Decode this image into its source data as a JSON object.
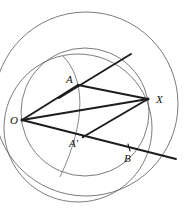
{
  "figure": {
    "background_color": "#ffffff",
    "stroke_color": "#1d1d1d",
    "curve_color": "#5b5b5b",
    "width": 186,
    "height": 213,
    "labels": [
      {
        "name": "label-O",
        "text": "O",
        "x": 10,
        "y": 124
      },
      {
        "name": "label-A",
        "text": "A",
        "x": 66,
        "y": 83
      },
      {
        "name": "label-A-prime",
        "text": "A′",
        "x": 69,
        "y": 147
      },
      {
        "name": "label-X",
        "text": "X",
        "x": 156,
        "y": 103
      },
      {
        "name": "label-B",
        "text": "B",
        "x": 124,
        "y": 162
      }
    ],
    "points": [
      {
        "name": "point-O",
        "label": "O",
        "x": 22,
        "y": 120
      },
      {
        "name": "point-A",
        "label": "A",
        "x": 78,
        "y": 85
      },
      {
        "name": "point-A-prime",
        "label": "A'",
        "x": 83,
        "y": 137
      },
      {
        "name": "point-X",
        "label": "X",
        "x": 148,
        "y": 99
      },
      {
        "name": "point-B",
        "label": "B",
        "x": 128,
        "y": 150
      }
    ],
    "circles": [
      {
        "name": "circle-large-upper",
        "cx": 86,
        "cy": 104,
        "r": 92
      },
      {
        "name": "circle-lower-left",
        "cx": 78,
        "cy": 128,
        "r": 74
      },
      {
        "name": "circle-through-O-X",
        "cx": 85,
        "cy": 112,
        "r": 64
      }
    ],
    "arcs": [
      {
        "name": "arc-through-A-and-A-prime",
        "d": "M 63 56 C 84 78, 88 118, 60 177"
      }
    ],
    "segments": [
      {
        "name": "segment-O-A",
        "x1": 22,
        "y1": 120,
        "x2": 78,
        "y2": 85
      },
      {
        "name": "segment-A-X",
        "x1": 78,
        "y1": 85,
        "x2": 148,
        "y2": 99
      },
      {
        "name": "segment-O-X",
        "x1": 22,
        "y1": 120,
        "x2": 148,
        "y2": 99
      },
      {
        "name": "segment-A-prime-X",
        "x1": 83,
        "y1": 137,
        "x2": 148,
        "y2": 99
      }
    ],
    "rays": [
      {
        "name": "ray-O-through-B",
        "x1": 22,
        "y1": 120,
        "x2": 176,
        "y2": 159
      },
      {
        "name": "ray-through-A-diagonal",
        "x1": 59,
        "y1": 98,
        "x2": 131,
        "y2": 54
      }
    ],
    "ticks": [
      {
        "name": "tick-on-ray-near-B",
        "x1": 128,
        "y1": 145,
        "x2": 130,
        "y2": 152
      }
    ]
  }
}
